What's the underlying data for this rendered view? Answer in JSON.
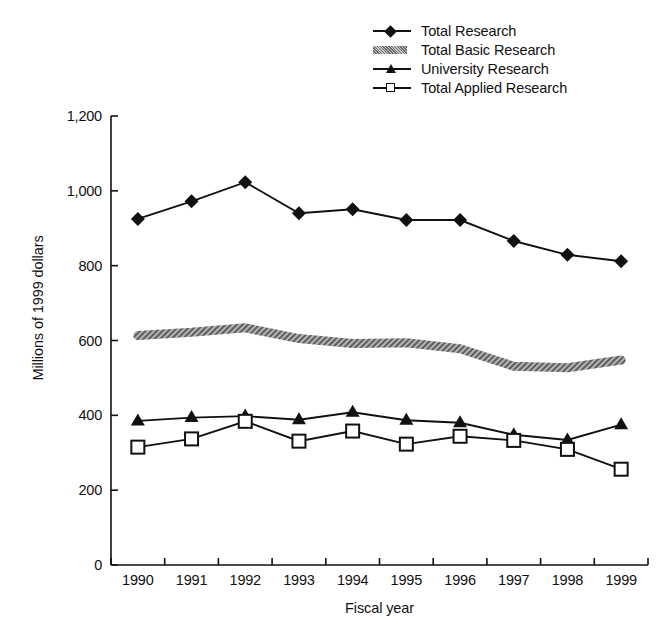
{
  "chart_data": {
    "type": "line",
    "title": "",
    "xlabel": "Fiscal year",
    "ylabel": "Millions of 1999 dollars",
    "categories": [
      "1990",
      "1991",
      "1992",
      "1993",
      "1994",
      "1995",
      "1996",
      "1997",
      "1998",
      "1999"
    ],
    "x": [
      1990,
      1991,
      1992,
      1993,
      1994,
      1995,
      1996,
      1997,
      1998,
      1999
    ],
    "ylim": [
      0,
      1200
    ],
    "yticks": [
      0,
      200,
      400,
      600,
      800,
      1000,
      1200
    ],
    "ytick_labels": [
      "0",
      "200",
      "400",
      "600",
      "800",
      "1,000",
      "1,200"
    ],
    "grid": false,
    "legend_position": "top-right",
    "series": [
      {
        "name": "Total Research",
        "marker": "filled-diamond",
        "color": "#111111",
        "values": [
          925,
          972,
          1023,
          940,
          951,
          922,
          922,
          866,
          829,
          812
        ]
      },
      {
        "name": "Total Basic Research",
        "marker": "hatched-band",
        "color": "#9a9a9a",
        "values": [
          613,
          622,
          634,
          605,
          592,
          594,
          578,
          531,
          527,
          548
        ]
      },
      {
        "name": "University Research",
        "marker": "filled-triangle",
        "color": "#111111",
        "values": [
          385,
          394,
          398,
          388,
          408,
          387,
          380,
          348,
          334,
          375
        ]
      },
      {
        "name": "Total Applied Research",
        "marker": "open-square",
        "color": "#111111",
        "values": [
          315,
          337,
          384,
          331,
          358,
          323,
          344,
          333,
          309,
          256
        ]
      }
    ]
  },
  "legend": {
    "items": [
      {
        "label": "Total Research",
        "key": "filled-diamond"
      },
      {
        "label": "Total Basic Research",
        "key": "hatched-band"
      },
      {
        "label": "University Research",
        "key": "filled-triangle"
      },
      {
        "label": "Total Applied Research",
        "key": "open-square"
      }
    ]
  },
  "axes": {
    "x_title": "Fiscal year",
    "y_title": "Millions of 1999 dollars"
  }
}
